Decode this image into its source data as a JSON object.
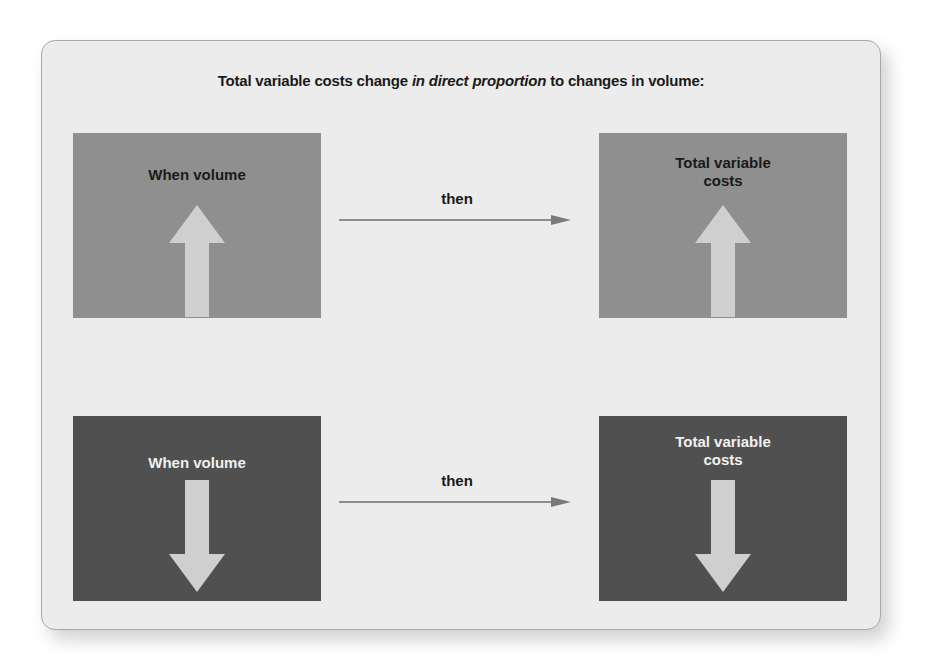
{
  "diagram": {
    "title_pre": "Total variable costs change ",
    "title_emph": "in direct proportion",
    "title_post": " to changes in volume:",
    "rows": [
      {
        "direction": "up",
        "left_box": {
          "label": "When  volume",
          "arrow": "up-arrow-icon"
        },
        "connector_label": "then",
        "right_box": {
          "label_line1": "Total variable",
          "label_line2": "costs",
          "arrow": "up-arrow-icon"
        },
        "box_color": "#8f8f8f"
      },
      {
        "direction": "down",
        "left_box": {
          "label": "When  volume",
          "arrow": "down-arrow-icon"
        },
        "connector_label": "then",
        "right_box": {
          "label_line1": "Total variable",
          "label_line2": "costs",
          "arrow": "down-arrow-icon"
        },
        "box_color": "#505050"
      }
    ],
    "colors": {
      "card_bg": "#ececec",
      "arrow_fill": "#cfcfcf",
      "connector_line": "#6e6e6e"
    }
  }
}
